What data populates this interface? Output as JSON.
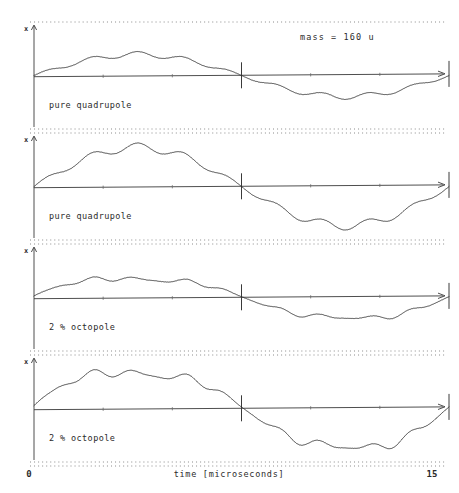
{
  "figure": {
    "annotation": "mass  =  160  u",
    "x_axis": {
      "title": "time   [microseconds]",
      "min_label": "0",
      "max_label": "15",
      "min_value": 0,
      "max_value": 15,
      "unit": "microseconds"
    },
    "y_axis": {
      "label": "x"
    },
    "colors": {
      "trace": "#2a2a2a",
      "axis": "#3a3a3a",
      "border": "#8a8a8a",
      "background": "#ffffff"
    }
  },
  "chart_data": {
    "type": "line",
    "xlabel": "time   [microseconds]",
    "ylabel": "x",
    "xlim": [
      0,
      15
    ],
    "grid": false,
    "legend": "none",
    "annotations": [
      "mass  =  160  u"
    ],
    "shared_x_ticks": [
      {
        "value": 0,
        "label": "0",
        "major": true
      },
      {
        "value": 7.5,
        "label": "",
        "major": true
      },
      {
        "value": 15,
        "label": "15",
        "major": true
      }
    ],
    "panels": [
      {
        "index": 0,
        "label": "pure quadrupole",
        "note": "mass  =  160  u",
        "secular_amplitude": 0.42,
        "secular_cycles": 1.0,
        "secular_phase": 0.0,
        "ripple_amplitude": 0.055,
        "ripple_cycles": 9.0,
        "ripple_phase": 0.0,
        "octopole_fraction": 0.0,
        "x": [
          0.0,
          0.75,
          1.5,
          2.25,
          3.0,
          3.75,
          4.5,
          5.25,
          6.0,
          6.75,
          7.5,
          8.25,
          9.0,
          9.75,
          10.5,
          11.25,
          12.0,
          12.75,
          13.5,
          14.25,
          15.0
        ],
        "y": [
          0.0,
          0.18,
          0.31,
          0.38,
          0.43,
          0.45,
          0.42,
          0.36,
          0.26,
          0.14,
          0.0,
          -0.14,
          -0.26,
          -0.36,
          -0.42,
          -0.45,
          -0.43,
          -0.38,
          -0.31,
          -0.18,
          0.0
        ]
      },
      {
        "index": 1,
        "label": "pure quadrupole",
        "note": "",
        "secular_amplitude": 0.78,
        "secular_cycles": 1.0,
        "secular_phase": 0.0,
        "ripple_amplitude": 0.085,
        "ripple_cycles": 9.0,
        "ripple_phase": 0.0,
        "octopole_fraction": 0.0,
        "x": [
          0.0,
          0.75,
          1.5,
          2.25,
          3.0,
          3.75,
          4.5,
          5.25,
          6.0,
          6.75,
          7.5,
          8.25,
          9.0,
          9.75,
          10.5,
          11.25,
          12.0,
          12.75,
          13.5,
          14.25,
          15.0
        ],
        "y": [
          0.0,
          0.33,
          0.58,
          0.71,
          0.79,
          0.83,
          0.78,
          0.67,
          0.48,
          0.26,
          0.0,
          -0.26,
          -0.48,
          -0.67,
          -0.78,
          -0.83,
          -0.79,
          -0.71,
          -0.58,
          -0.33,
          0.0
        ]
      },
      {
        "index": 2,
        "label": "2 % octopole",
        "note": "",
        "secular_amplitude": 0.42,
        "secular_cycles": 1.0,
        "secular_phase": 0.0,
        "ripple_amplitude": 0.055,
        "ripple_cycles": 9.0,
        "ripple_phase": 0.0,
        "octopole_fraction": 0.02,
        "x": [
          0.0,
          0.75,
          1.5,
          2.25,
          3.0,
          3.75,
          4.5,
          5.25,
          6.0,
          6.75,
          7.5,
          8.25,
          9.0,
          9.75,
          10.5,
          11.25,
          12.0,
          12.75,
          13.5,
          14.25,
          15.0
        ],
        "y": [
          0.0,
          0.18,
          0.31,
          0.38,
          0.43,
          0.45,
          0.42,
          0.36,
          0.26,
          0.14,
          0.0,
          -0.14,
          -0.26,
          -0.36,
          -0.42,
          -0.45,
          -0.43,
          -0.38,
          -0.31,
          -0.18,
          0.0
        ]
      },
      {
        "index": 3,
        "label": "2 % octopole",
        "note": "",
        "secular_amplitude": 0.8,
        "secular_cycles": 1.0,
        "secular_phase": 0.0,
        "ripple_amplitude": 0.095,
        "ripple_cycles": 9.0,
        "ripple_phase": 0.0,
        "octopole_fraction": 0.02,
        "x": [
          0.0,
          0.75,
          1.5,
          2.25,
          3.0,
          3.75,
          4.5,
          5.25,
          6.0,
          6.75,
          7.5,
          8.25,
          9.0,
          9.75,
          10.5,
          11.25,
          12.0,
          12.75,
          13.5,
          14.25,
          15.0
        ],
        "y": [
          0.0,
          0.36,
          0.62,
          0.76,
          0.82,
          0.84,
          0.79,
          0.68,
          0.5,
          0.27,
          0.0,
          -0.28,
          -0.52,
          -0.7,
          -0.8,
          -0.84,
          -0.81,
          -0.73,
          -0.6,
          -0.35,
          0.0
        ]
      }
    ]
  }
}
